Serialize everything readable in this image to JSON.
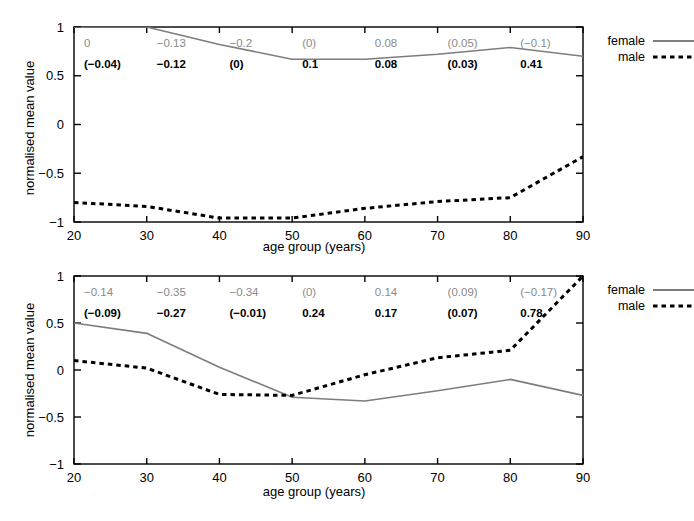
{
  "figure": {
    "width": 694,
    "height": 521,
    "background": "#ffffff"
  },
  "colors": {
    "female_line": "#7d7d7d",
    "male_line": "#000000",
    "axis": "#000000",
    "annotation_female": "#8a8a8a",
    "annotation_male": "#000000"
  },
  "legend": {
    "female_label": "female",
    "male_label": "male"
  },
  "axis_labels": {
    "x": "age group (years)",
    "y": "normalised mean value"
  },
  "chart_data": [
    {
      "id": "top",
      "type": "line",
      "title": "",
      "xlabel": "age group (years)",
      "ylabel": "normalised mean value",
      "xlim": [
        20,
        90
      ],
      "ylim": [
        -1,
        1
      ],
      "xticks": [
        20,
        30,
        40,
        50,
        60,
        70,
        80,
        90
      ],
      "xticklabels": [
        "20",
        "30",
        "40",
        "50",
        "60",
        "70",
        "80",
        "90"
      ],
      "yticks": [
        -1,
        -0.5,
        0,
        0.5,
        1
      ],
      "yticklabels": [
        "-1",
        "-0.5",
        "0",
        "0.5",
        "1"
      ],
      "grid": false,
      "legend_position": "right",
      "x": [
        20,
        30,
        40,
        50,
        60,
        70,
        80,
        90
      ],
      "series": [
        {
          "name": "female",
          "style": "solid",
          "color": "#7d7d7d",
          "values": [
            1.0,
            1.0,
            0.82,
            0.67,
            0.67,
            0.72,
            0.79,
            0.7
          ]
        },
        {
          "name": "male",
          "style": "dashed",
          "color": "#000000",
          "values": [
            -0.8,
            -0.84,
            -0.96,
            -0.96,
            -0.86,
            -0.79,
            -0.75,
            -0.33
          ]
        }
      ],
      "annotations": {
        "x_positions": [
          20,
          30,
          40,
          50,
          60,
          70,
          80
        ],
        "female_row": [
          "0",
          "-0.13",
          "-0.2",
          "(0)",
          "0.08",
          "(0.05)",
          "(-0.1)"
        ],
        "male_row": [
          "(-0.04)",
          "-0.12",
          "(0)",
          "0.1",
          "0.08",
          "(0.03)",
          "0.41"
        ]
      }
    },
    {
      "id": "bottom",
      "type": "line",
      "title": "",
      "xlabel": "age group (years)",
      "ylabel": "normalised mean value",
      "xlim": [
        20,
        90
      ],
      "ylim": [
        -1,
        1
      ],
      "xticks": [
        20,
        30,
        40,
        50,
        60,
        70,
        80,
        90
      ],
      "xticklabels": [
        "20",
        "30",
        "40",
        "50",
        "60",
        "70",
        "80",
        "90"
      ],
      "yticks": [
        -1,
        -0.5,
        0,
        0.5,
        1
      ],
      "yticklabels": [
        "-1",
        "-0.5",
        "0",
        "0.5",
        "1"
      ],
      "grid": false,
      "legend_position": "right",
      "x": [
        20,
        30,
        40,
        50,
        60,
        70,
        80,
        90
      ],
      "series": [
        {
          "name": "female",
          "style": "solid",
          "color": "#7d7d7d",
          "values": [
            0.5,
            0.39,
            0.03,
            -0.29,
            -0.33,
            -0.22,
            -0.1,
            -0.27
          ]
        },
        {
          "name": "male",
          "style": "dashed",
          "color": "#000000",
          "values": [
            0.1,
            0.02,
            -0.26,
            -0.27,
            -0.05,
            0.13,
            0.21,
            1.0
          ]
        }
      ],
      "annotations": {
        "x_positions": [
          20,
          30,
          40,
          50,
          60,
          70,
          80
        ],
        "female_row": [
          "-0.14",
          "-0.35",
          "-0.34",
          "(0)",
          "0.14",
          "(0.09)",
          "(-0.17)"
        ],
        "male_row": [
          "(-0.09)",
          "-0.27",
          "(-0.01)",
          "0.24",
          "0.17",
          "(0.07)",
          "0.78"
        ]
      }
    }
  ]
}
